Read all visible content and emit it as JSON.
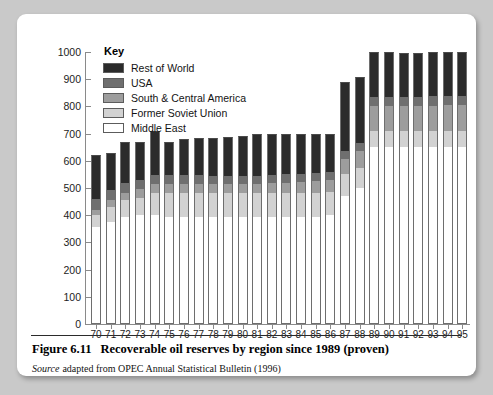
{
  "figure": {
    "number_label": "Figure 6.11",
    "title": "Recoverable oil reserves by region since 1989 (proven)",
    "source_word": "Source",
    "source_text": "adapted from OPEC Annual Statistical Bulletin (1996)"
  },
  "legend": {
    "title": "Key",
    "entries": [
      {
        "label": "Rest of World",
        "color": "#2b2b2b"
      },
      {
        "label": "USA",
        "color": "#6f6f6f"
      },
      {
        "label": "South & Central America",
        "color": "#9d9d9d"
      },
      {
        "label": "Former Soviet Union",
        "color": "#d2d2d2"
      },
      {
        "label": "Middle East",
        "color": "#ffffff"
      }
    ]
  },
  "chart_data": {
    "type": "bar",
    "subtype": "stacked",
    "title": "Recoverable oil reserves by region since 1989 (proven)",
    "xlabel": "",
    "ylabel": "",
    "ylim": [
      0,
      1000
    ],
    "ytick_step": 100,
    "yticks": [
      1000,
      900,
      800,
      700,
      600,
      500,
      400,
      300,
      200,
      100,
      0
    ],
    "grid": false,
    "legend_position": "inside-top-left",
    "categories": [
      "70",
      "71",
      "72",
      "73",
      "74",
      "75",
      "76",
      "77",
      "78",
      "79",
      "80",
      "81",
      "82",
      "83",
      "84",
      "85",
      "86",
      "87",
      "88",
      "89",
      "90",
      "91",
      "92",
      "93",
      "94",
      "95"
    ],
    "stack_order_bottom_to_top": [
      "Middle East",
      "Former Soviet Union",
      "South & Central America",
      "USA",
      "Rest of World"
    ],
    "series": [
      {
        "name": "Middle East",
        "color": "#ffffff",
        "values": [
          355,
          375,
          395,
          400,
          400,
          395,
          395,
          395,
          395,
          395,
          395,
          395,
          395,
          395,
          395,
          395,
          400,
          470,
          500,
          650,
          650,
          650,
          650,
          650,
          650,
          650
        ]
      },
      {
        "name": "Former Soviet Union",
        "color": "#d2d2d2",
        "values": [
          45,
          55,
          60,
          65,
          80,
          85,
          85,
          85,
          85,
          85,
          85,
          85,
          85,
          85,
          85,
          85,
          85,
          80,
          75,
          60,
          60,
          60,
          60,
          60,
          60,
          60
        ]
      },
      {
        "name": "South & Central America",
        "color": "#9d9d9d",
        "values": [
          20,
          25,
          28,
          30,
          35,
          35,
          35,
          35,
          35,
          35,
          35,
          35,
          38,
          40,
          42,
          45,
          45,
          55,
          60,
          90,
          90,
          90,
          90,
          92,
          95,
          95
        ]
      },
      {
        "name": "USA",
        "color": "#6f6f6f",
        "values": [
          40,
          38,
          36,
          35,
          34,
          33,
          32,
          32,
          31,
          31,
          30,
          30,
          30,
          30,
          30,
          30,
          30,
          30,
          30,
          35,
          35,
          35,
          35,
          35,
          35,
          35
        ]
      },
      {
        "name": "Rest of World",
        "color": "#2b2b2b",
        "values": [
          160,
          137,
          151,
          140,
          161,
          122,
          133,
          138,
          137,
          140,
          145,
          155,
          152,
          150,
          148,
          145,
          140,
          255,
          245,
          165,
          165,
          160,
          160,
          163,
          160,
          160
        ]
      }
    ],
    "totals": [
      620,
      630,
      670,
      670,
      710,
      670,
      680,
      685,
      683,
      686,
      690,
      700,
      700,
      700,
      700,
      700,
      700,
      890,
      910,
      1000,
      1000,
      995,
      995,
      1000,
      1000,
      1000
    ]
  }
}
